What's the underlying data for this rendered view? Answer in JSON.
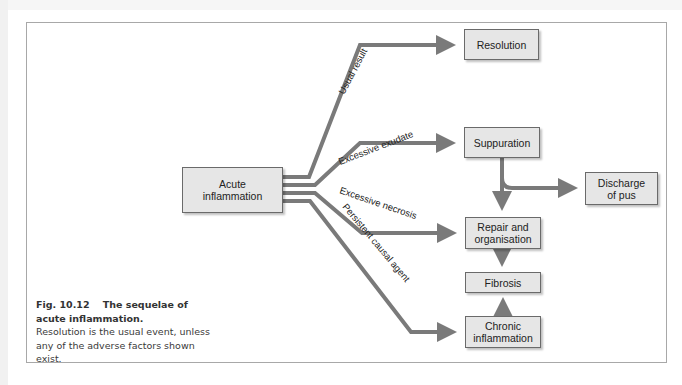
{
  "figure": {
    "number": "Fig. 10.12",
    "title": "The sequelae of acute inflammation.",
    "title_line1": "Fig. 10.12    The sequelae of",
    "title_line2": "acute inflammation.",
    "description": "Resolution is the usual event, unless any of the adverse factors shown exist."
  },
  "nodes": {
    "acute": {
      "line1": "Acute",
      "line2": "inflammation"
    },
    "resolution": {
      "label": "Resolution"
    },
    "suppuration": {
      "label": "Suppuration"
    },
    "discharge": {
      "line1": "Discharge",
      "line2": "of pus"
    },
    "repair": {
      "line1": "Repair and",
      "line2": "organisation"
    },
    "fibrosis": {
      "label": "Fibrosis"
    },
    "chronic": {
      "line1": "Chronic",
      "line2": "inflammation"
    }
  },
  "edges": {
    "usual_result": "Usual result",
    "excessive_exudate": "Excessive exudate",
    "excessive_necrosis": "Excessive necrosis",
    "persistent_agent": "Persistent causal agent"
  },
  "colors": {
    "arrow": "#7a7a7a",
    "node_fill": "#e6e6e6",
    "node_border": "#6a6a6a",
    "frame_border": "#a8a8a8"
  }
}
